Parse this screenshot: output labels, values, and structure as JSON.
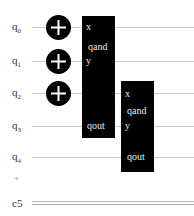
{
  "qubits": [
    {
      "label": "q",
      "index": "0",
      "y": 27
    },
    {
      "label": "q",
      "index": "1",
      "y": 61
    },
    {
      "label": "q",
      "index": "2",
      "y": 93
    },
    {
      "label": "q",
      "index": "3",
      "y": 126
    },
    {
      "label": "q",
      "index": "4",
      "y": 157
    }
  ],
  "plus_marker": "+",
  "classical": {
    "label": "c5",
    "y": 203
  },
  "gates": {
    "x_gates": [
      {
        "wire": 0
      },
      {
        "wire": 1
      },
      {
        "wire": 2
      }
    ],
    "blocks": [
      {
        "name": "qand",
        "x_label": "x",
        "y_label": "y",
        "out_label": "qout"
      },
      {
        "name": "qand",
        "x_label": "x",
        "y_label": "y",
        "out_label": "qout"
      }
    ]
  }
}
